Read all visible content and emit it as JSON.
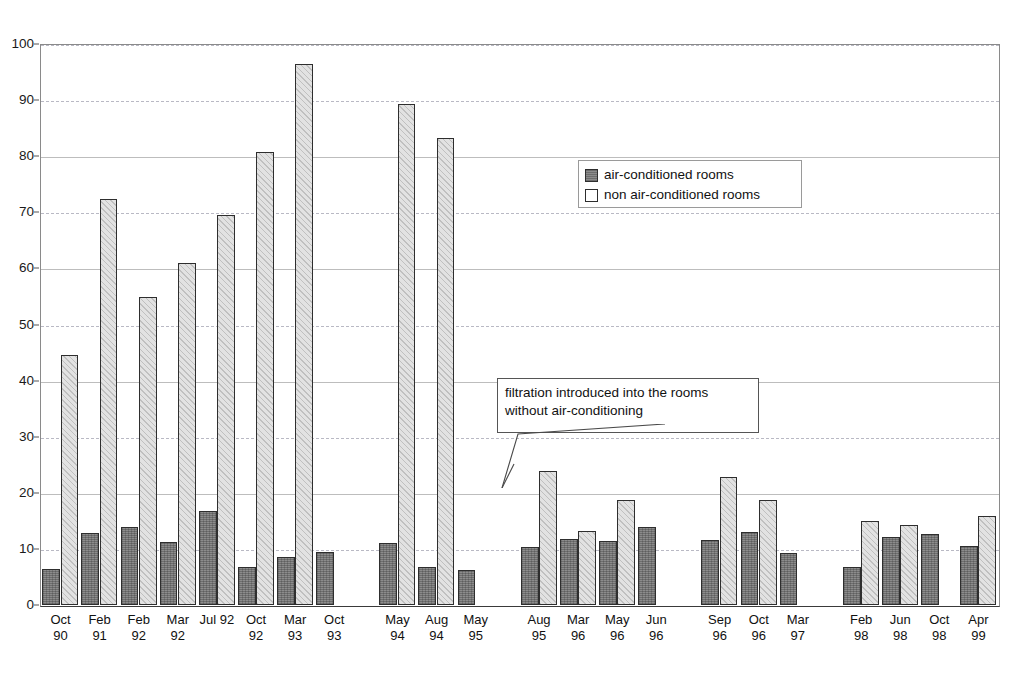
{
  "chart_data": {
    "type": "bar",
    "title": "",
    "subtitle": "",
    "xlabel": "",
    "ylabel": "",
    "ylim": [
      0,
      100
    ],
    "ytick_step": 10,
    "yticks": [
      0,
      10,
      20,
      30,
      40,
      50,
      60,
      70,
      80,
      90,
      100
    ],
    "grid": true,
    "legend_position": "top-right",
    "categories": [
      "Oct 90",
      "Feb 91",
      "Feb 92",
      "Mar 92",
      "Jul 92",
      "Oct 92",
      "Mar 93",
      "Oct 93",
      "May 94",
      "Aug 94",
      "May 95",
      "Aug 95",
      "Mar 96",
      "May 96",
      "Jun 96",
      "Sep 96",
      "Oct 96",
      "Mar 97",
      "Feb 98",
      "Jun 98",
      "Oct 98",
      "Apr 99"
    ],
    "category_lines": [
      [
        "Oct",
        "90"
      ],
      [
        "Feb",
        "91"
      ],
      [
        "Feb",
        "92"
      ],
      [
        "Mar",
        "92"
      ],
      [
        "Jul 92",
        ""
      ],
      [
        "Oct",
        "92"
      ],
      [
        "Mar",
        "93"
      ],
      [
        "Oct",
        "93"
      ],
      [
        "May",
        "94"
      ],
      [
        "Aug",
        "94"
      ],
      [
        "May",
        "95"
      ],
      [
        "Aug",
        "95"
      ],
      [
        "Mar",
        "96"
      ],
      [
        "May",
        "96"
      ],
      [
        "Jun",
        "96"
      ],
      [
        "Sep",
        "96"
      ],
      [
        "Oct",
        "96"
      ],
      [
        "Mar",
        "97"
      ],
      [
        "Feb",
        "98"
      ],
      [
        "Jun",
        "98"
      ],
      [
        "Oct",
        "98"
      ],
      [
        "Apr",
        "99"
      ]
    ],
    "series": [
      {
        "name": "air-conditioned rooms",
        "color": "#8c8c8c",
        "values": [
          6.4,
          12.8,
          13.9,
          11.2,
          16.8,
          6.8,
          8.5,
          9.4,
          11.0,
          6.8,
          6.3,
          10.3,
          11.8,
          11.5,
          13.9,
          11.6,
          13.0,
          9.2,
          6.8,
          12.1,
          12.7,
          10.6
        ]
      },
      {
        "name": "non air-conditioned rooms",
        "color": "#e2e2e2",
        "values": [
          44.6,
          72.3,
          54.9,
          60.9,
          69.5,
          80.8,
          96.5,
          null,
          89.3,
          83.3,
          null,
          23.9,
          13.2,
          18.7,
          null,
          22.9,
          18.7,
          null,
          14.9,
          14.3,
          null,
          15.8
        ]
      }
    ],
    "group_breaks_after": [
      7,
      10,
      14,
      17
    ],
    "annotations": [
      {
        "id": "filtration-note",
        "lines": [
          "filtration introduced into the rooms",
          "without air-conditioning"
        ],
        "points_to": "Aug 95"
      }
    ]
  },
  "legend": {
    "items": [
      {
        "label": "air-conditioned rooms",
        "swatch": "dark"
      },
      {
        "label": "non air-conditioned rooms",
        "swatch": "light"
      }
    ]
  }
}
